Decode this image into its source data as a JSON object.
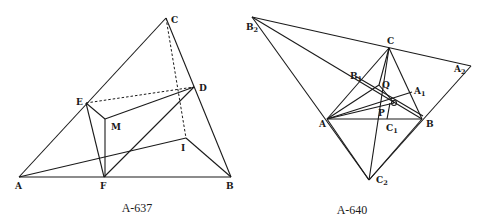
{
  "figures": [
    {
      "caption": "A-637",
      "labels": {
        "A": "A",
        "B": "B",
        "C": "C",
        "D": "D",
        "E": "E",
        "F": "F",
        "M": "M",
        "I": "I"
      }
    },
    {
      "caption": "A-640",
      "labels": {
        "A": "A",
        "B": "B",
        "C": "C",
        "P": "P",
        "Q": "Q",
        "O": "O",
        "A1": "A",
        "A1_sub": "1",
        "B1": "B",
        "B1_sub": "1",
        "C1": "C",
        "C1_sub": "1",
        "A2": "A",
        "A2_sub": "2",
        "B2": "B",
        "B2_sub": "2",
        "C2": "C",
        "C2_sub": "2"
      }
    }
  ]
}
